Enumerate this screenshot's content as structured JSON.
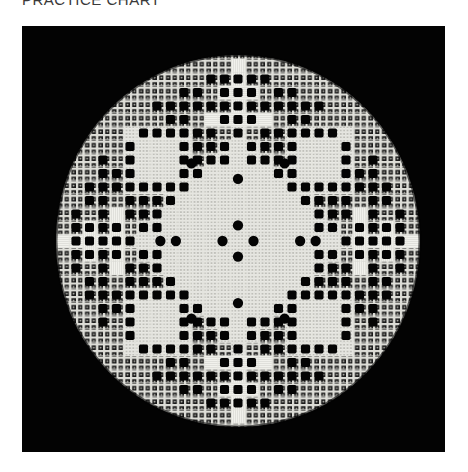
{
  "caption": "PRACTICE CHART",
  "photo": {
    "subject": "Hardanger embroidery circular sampler on black background",
    "background_color": "#030303",
    "thread_color": "#e9e9e4",
    "fabric_color": "#d4d4cf",
    "circle": {
      "cx": 216,
      "cy": 215,
      "rx": 182,
      "ry": 186
    },
    "cell": 13.5,
    "quadrant_open_squares": [
      [
        1,
        -12
      ],
      [
        2,
        -12
      ],
      [
        3,
        -11
      ],
      [
        1,
        -10
      ],
      [
        2,
        -10
      ],
      [
        3,
        -10
      ],
      [
        4,
        -10
      ],
      [
        5,
        -10
      ],
      [
        6,
        -10
      ],
      [
        4,
        -9
      ],
      [
        2,
        -8
      ],
      [
        3,
        -8
      ],
      [
        4,
        -8
      ],
      [
        5,
        -8
      ],
      [
        6,
        -8
      ],
      [
        7,
        -8
      ],
      [
        1,
        -7
      ],
      [
        2,
        -7
      ],
      [
        3,
        -7
      ],
      [
        8,
        -7
      ],
      [
        2,
        -6
      ],
      [
        3,
        -6
      ],
      [
        8,
        -6
      ],
      [
        3,
        -5
      ],
      [
        8,
        -5
      ],
      [
        9,
        -5
      ],
      [
        4,
        -4
      ],
      [
        5,
        -4
      ],
      [
        6,
        -4
      ],
      [
        7,
        -4
      ],
      [
        10,
        -4
      ],
      [
        11,
        -4
      ],
      [
        5,
        -3
      ],
      [
        6,
        -3
      ],
      [
        7,
        -3
      ],
      [
        8,
        -3
      ],
      [
        10,
        -3
      ],
      [
        11,
        -3
      ],
      [
        7,
        -2
      ],
      [
        8,
        -2
      ],
      [
        9,
        -1
      ],
      [
        10,
        -1
      ],
      [
        11,
        -1
      ],
      [
        12,
        -1
      ],
      [
        6,
        -1
      ],
      [
        7,
        -1
      ],
      [
        12,
        0
      ],
      [
        8,
        0
      ],
      [
        9,
        0
      ],
      [
        10,
        0
      ],
      [
        11,
        0
      ]
    ],
    "kloster_blocks": [
      {
        "x": 0,
        "y": -12,
        "w": 1,
        "h": 6,
        "dir": "v"
      },
      {
        "x": -3,
        "y": -9,
        "w": 7,
        "h": 1.2,
        "dir": "h"
      },
      {
        "x": -3,
        "y": -7.4,
        "w": 7,
        "h": 1.2,
        "dir": "h"
      }
    ],
    "round_holes": [
      [
        0,
        -1
      ],
      [
        1,
        0
      ],
      [
        0,
        1
      ],
      [
        -1,
        0
      ],
      [
        0,
        -4
      ],
      [
        4,
        0
      ],
      [
        0,
        4
      ],
      [
        -4,
        0
      ],
      [
        -3,
        -5
      ],
      [
        3,
        -5
      ],
      [
        -5,
        0
      ],
      [
        5,
        0
      ],
      [
        3,
        5
      ],
      [
        -3,
        5
      ]
    ]
  }
}
